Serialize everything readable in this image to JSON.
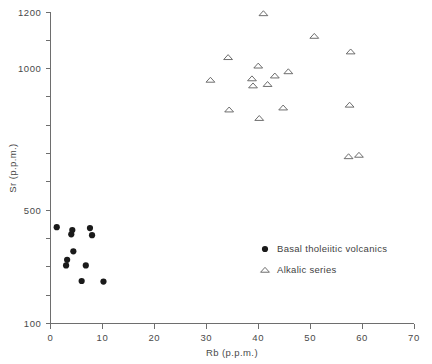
{
  "chart_data": {
    "type": "scatter",
    "title": "",
    "xlabel": "Rb (p.p.m.)",
    "ylabel": "Sr (p.p.m.)",
    "xlim": [
      0,
      70
    ],
    "ylim": [
      100,
      1200
    ],
    "xticks": [
      0,
      10,
      20,
      30,
      40,
      50,
      60,
      70
    ],
    "xtick_labels": [
      "0",
      "10",
      "20",
      "30",
      "40",
      "50",
      "60",
      "70"
    ],
    "yticks": [
      100,
      200,
      300,
      400,
      500,
      600,
      700,
      800,
      900,
      1000,
      1100,
      1200
    ],
    "ytick_labels": [
      "100",
      "",
      "",
      "",
      "500",
      "",
      "",
      "",
      "",
      "1000",
      "",
      "1200"
    ],
    "grid": false,
    "legend_position": "center-right",
    "series": [
      {
        "name": "Basal tholeiitic volcanics",
        "marker": "filled-circle",
        "color": "#1a1a1a",
        "points": [
          [
            1.2,
            440
          ],
          [
            4.2,
            430
          ],
          [
            4.0,
            415
          ],
          [
            7.6,
            437
          ],
          [
            8.0,
            412
          ],
          [
            4.4,
            355
          ],
          [
            3.2,
            325
          ],
          [
            3.0,
            305
          ],
          [
            6.8,
            305
          ],
          [
            6.0,
            250
          ],
          [
            10.2,
            248
          ]
        ]
      },
      {
        "name": "Alkalic series",
        "marker": "open-triangle",
        "color": "#5d5d5d",
        "points": [
          [
            41.0,
            1195
          ],
          [
            50.8,
            1115
          ],
          [
            34.2,
            1040
          ],
          [
            57.8,
            1060
          ],
          [
            40.0,
            1010
          ],
          [
            38.8,
            965
          ],
          [
            39.0,
            940
          ],
          [
            30.8,
            960
          ],
          [
            43.2,
            975
          ],
          [
            45.8,
            990
          ],
          [
            41.8,
            945
          ],
          [
            40.2,
            825
          ],
          [
            34.4,
            855
          ],
          [
            44.8,
            862
          ],
          [
            57.6,
            872
          ],
          [
            57.4,
            690
          ],
          [
            59.4,
            695
          ]
        ]
      }
    ]
  },
  "axes": {
    "x_title": "Rb (p.p.m.)",
    "y_title": "Sr (p.p.m.)",
    "x_labels": [
      "0",
      "10",
      "20",
      "30",
      "40",
      "50",
      "60",
      "70"
    ],
    "y_labels": [
      "100",
      "500",
      "1000",
      "1200"
    ]
  },
  "legend": {
    "entries": [
      {
        "marker": "filled-circle",
        "label": "Basal tholeiitic volcanics"
      },
      {
        "marker": "open-triangle",
        "label": "Alkalic series"
      }
    ]
  }
}
